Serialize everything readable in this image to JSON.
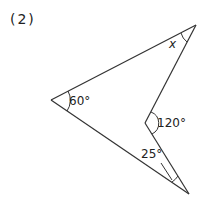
{
  "problem_number": "(2)",
  "angles": {
    "left": "60°",
    "top_right": "x",
    "inner": "120°",
    "bottom": "25°"
  },
  "colors": {
    "stroke": "#333333",
    "text": "#222222"
  }
}
